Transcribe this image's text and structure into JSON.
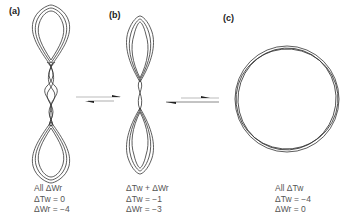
{
  "panels": [
    {
      "id": "a",
      "label": "(a)",
      "description": "Interwound supercoil (plectoneme) with two terminal loops",
      "caption": [
        "All ΔWr",
        "ΔTw = 0",
        "ΔWr = −4"
      ]
    },
    {
      "id": "b",
      "label": "(b)",
      "description": "Intermediate figure-eight supercoil",
      "caption": [
        "ΔTw + ΔWr",
        "ΔTw = −1",
        "ΔWr = −3"
      ]
    },
    {
      "id": "c",
      "label": "(c)",
      "description": "Relaxed circular duplex with all linking change as twist",
      "caption": [
        "All ΔTw",
        "ΔTw = −4",
        "ΔWr = 0"
      ]
    }
  ],
  "arrows": [
    {
      "between": [
        "a",
        "b"
      ],
      "type": "equilibrium-half-arrows"
    },
    {
      "between": [
        "b",
        "c"
      ],
      "type": "equilibrium-half-arrows"
    }
  ],
  "colors": {
    "strand": "#333333",
    "arrow": "#222222",
    "arrow_tint": "#bbbbbb",
    "text": "#555555"
  }
}
